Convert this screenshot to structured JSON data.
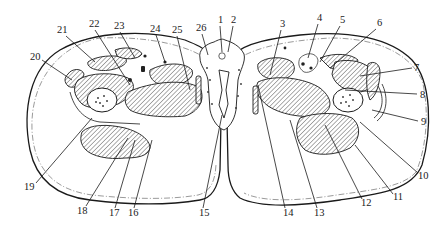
{
  "figure": {
    "colors": {
      "ink": "#1a1a1a",
      "background": "#ffffff",
      "hatch": "#333333"
    }
  },
  "labels": [
    {
      "id": "1",
      "text": "1",
      "x": 218,
      "y": 23,
      "lx1": 220,
      "ly1": 26,
      "lx2": 222,
      "ly2": 52
    },
    {
      "id": "2",
      "text": "2",
      "x": 231,
      "y": 23,
      "lx1": 233,
      "ly1": 26,
      "lx2": 228,
      "ly2": 52
    },
    {
      "id": "3",
      "text": "3",
      "x": 280,
      "y": 27,
      "lx1": 281,
      "ly1": 30,
      "lx2": 270,
      "ly2": 75
    },
    {
      "id": "4",
      "text": "4",
      "x": 317,
      "y": 21,
      "lx1": 318,
      "ly1": 24,
      "lx2": 308,
      "ly2": 58
    },
    {
      "id": "5",
      "text": "5",
      "x": 340,
      "y": 23,
      "lx1": 340,
      "ly1": 26,
      "lx2": 320,
      "ly2": 62
    },
    {
      "id": "6",
      "text": "6",
      "x": 377,
      "y": 26,
      "lx1": 376,
      "ly1": 29,
      "lx2": 330,
      "ly2": 68
    },
    {
      "id": "7",
      "text": "7",
      "x": 414,
      "y": 71,
      "lx1": 412,
      "ly1": 68,
      "lx2": 360,
      "ly2": 76
    },
    {
      "id": "8",
      "text": "8",
      "x": 420,
      "y": 98,
      "lx1": 417,
      "ly1": 94,
      "lx2": 345,
      "ly2": 90
    },
    {
      "id": "9",
      "text": "9",
      "x": 421,
      "y": 125,
      "lx1": 418,
      "ly1": 121,
      "lx2": 372,
      "ly2": 110
    },
    {
      "id": "10",
      "text": "10",
      "x": 418,
      "y": 179,
      "lx1": 418,
      "ly1": 173,
      "lx2": 360,
      "ly2": 122
    },
    {
      "id": "11",
      "text": "11",
      "x": 393,
      "y": 200,
      "lx1": 393,
      "ly1": 194,
      "lx2": 355,
      "ly2": 145
    },
    {
      "id": "12",
      "text": "12",
      "x": 361,
      "y": 206,
      "lx1": 362,
      "ly1": 199,
      "lx2": 325,
      "ly2": 125
    },
    {
      "id": "13",
      "text": "13",
      "x": 314,
      "y": 216,
      "lx1": 317,
      "ly1": 208,
      "lx2": 290,
      "ly2": 120
    },
    {
      "id": "14",
      "text": "14",
      "x": 283,
      "y": 216,
      "lx1": 285,
      "ly1": 208,
      "lx2": 258,
      "ly2": 85
    },
    {
      "id": "15",
      "text": "15",
      "x": 199,
      "y": 216,
      "lx1": 203,
      "ly1": 208,
      "lx2": 222,
      "ly2": 115
    },
    {
      "id": "16",
      "text": "16",
      "x": 128,
      "y": 216,
      "lx1": 134,
      "ly1": 208,
      "lx2": 152,
      "ly2": 140
    },
    {
      "id": "17",
      "text": "17",
      "x": 109,
      "y": 216,
      "lx1": 115,
      "ly1": 208,
      "lx2": 135,
      "ly2": 140
    },
    {
      "id": "18",
      "text": "18",
      "x": 77,
      "y": 214,
      "lx1": 86,
      "ly1": 206,
      "lx2": 128,
      "ly2": 138
    },
    {
      "id": "19",
      "text": "19",
      "x": 24,
      "y": 190,
      "lx1": 36,
      "ly1": 183,
      "lx2": 92,
      "ly2": 118
    },
    {
      "id": "20",
      "text": "20",
      "x": 30,
      "y": 60,
      "lx1": 42,
      "ly1": 60,
      "lx2": 72,
      "ly2": 80
    },
    {
      "id": "21",
      "text": "21",
      "x": 57,
      "y": 33,
      "lx1": 66,
      "ly1": 36,
      "lx2": 95,
      "ly2": 62
    },
    {
      "id": "22",
      "text": "22",
      "x": 89,
      "y": 27,
      "lx1": 95,
      "ly1": 30,
      "lx2": 130,
      "ly2": 85
    },
    {
      "id": "23",
      "text": "23",
      "x": 114,
      "y": 29,
      "lx1": 120,
      "ly1": 32,
      "lx2": 135,
      "ly2": 58
    },
    {
      "id": "24",
      "text": "24",
      "x": 150,
      "y": 32,
      "lx1": 156,
      "ly1": 35,
      "lx2": 165,
      "ly2": 62
    },
    {
      "id": "25",
      "text": "25",
      "x": 172,
      "y": 33,
      "lx1": 177,
      "ly1": 36,
      "lx2": 190,
      "ly2": 90
    },
    {
      "id": "26",
      "text": "26",
      "x": 196,
      "y": 31,
      "lx1": 202,
      "ly1": 34,
      "lx2": 208,
      "ly2": 55
    }
  ]
}
